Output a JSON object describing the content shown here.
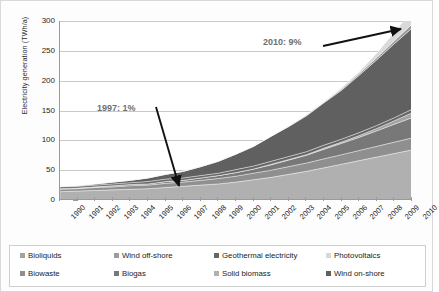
{
  "chart_data": {
    "type": "area",
    "stacked": true,
    "title": "",
    "xlabel": "",
    "ylabel": "Electricity generation (TWh/a)",
    "ylim": [
      0,
      300
    ],
    "yticks": [
      0,
      50,
      100,
      150,
      200,
      250,
      300
    ],
    "grid": true,
    "legend_position": "bottom",
    "x": [
      1990,
      1991,
      1992,
      1993,
      1994,
      1995,
      1996,
      1997,
      1998,
      1999,
      2000,
      2001,
      2002,
      2003,
      2004,
      2005,
      2006,
      2007,
      2008,
      2009,
      2010
    ],
    "categories": [
      "1990",
      "1991",
      "1992",
      "1993",
      "1994",
      "1995",
      "1996",
      "1997",
      "1998",
      "1999",
      "2000",
      "2001",
      "2002",
      "2003",
      "2004",
      "2005",
      "2006",
      "2007",
      "2008",
      "2009",
      "2010"
    ],
    "series": [
      {
        "name": "Solid biomass",
        "color": "#b0b0b0",
        "values": [
          14,
          15,
          16,
          17,
          18,
          19,
          21,
          23,
          25,
          27,
          30,
          34,
          38,
          43,
          48,
          54,
          60,
          66,
          72,
          78,
          84
        ]
      },
      {
        "name": "Biowaste",
        "color": "#8f8f8f",
        "values": [
          4,
          4,
          5,
          5,
          6,
          6,
          7,
          7,
          8,
          9,
          10,
          11,
          12,
          13,
          14,
          15,
          16,
          17,
          18,
          19,
          20
        ]
      },
      {
        "name": "Biogas",
        "color": "#787878",
        "values": [
          1,
          1,
          1,
          2,
          2,
          2,
          3,
          3,
          4,
          5,
          6,
          7,
          9,
          11,
          13,
          16,
          19,
          22,
          26,
          30,
          34
        ]
      },
      {
        "name": "Bioliquids",
        "color": "#a3a3a3",
        "values": [
          0,
          0,
          0,
          0,
          0,
          0,
          0,
          0,
          0,
          0,
          0,
          0,
          1,
          1,
          1,
          2,
          2,
          3,
          4,
          6,
          8
        ]
      },
      {
        "name": "Geothermal electricity",
        "color": "#666666",
        "values": [
          3,
          3,
          3,
          3,
          3,
          4,
          4,
          4,
          4,
          4,
          5,
          5,
          5,
          5,
          5,
          5,
          5,
          5,
          5,
          5,
          6
        ]
      },
      {
        "name": "Wind on-shore",
        "color": "#606060",
        "values": [
          1,
          1,
          2,
          3,
          4,
          6,
          8,
          11,
          15,
          20,
          26,
          33,
          42,
          50,
          60,
          71,
          82,
          96,
          110,
          124,
          136
        ]
      },
      {
        "name": "Wind off-shore",
        "color": "#9c9c9c",
        "values": [
          0,
          0,
          0,
          0,
          0,
          0,
          0,
          0,
          0,
          0,
          0,
          0,
          0,
          1,
          1,
          1,
          2,
          3,
          4,
          5,
          7
        ]
      },
      {
        "name": "Photovoltaics",
        "color": "#d9d9d9",
        "values": [
          0,
          0,
          0,
          0,
          0,
          0,
          0,
          0,
          0,
          0,
          0,
          0,
          0,
          0,
          1,
          1,
          2,
          3,
          7,
          14,
          22
        ]
      }
    ],
    "totals": [
      23,
      24,
      27,
      30,
      33,
      37,
      43,
      48,
      56,
      65,
      77,
      90,
      107,
      124,
      142,
      165,
      188,
      215,
      246,
      281,
      317
    ],
    "annotations": [
      {
        "text": "1997: 1%",
        "target_year": 1997
      },
      {
        "text": "2010: 9%",
        "target_year": 2010
      }
    ]
  },
  "axis": {
    "y_title": "Electricity generation (TWh/a)",
    "y_ticks": [
      "300",
      "250",
      "200",
      "150",
      "100",
      "50",
      "0"
    ],
    "x_ticks": [
      "1990",
      "1991",
      "1992",
      "1993",
      "1994",
      "1995",
      "1996",
      "1997",
      "1998",
      "1999",
      "2000",
      "2001",
      "2002",
      "2003",
      "2004",
      "2005",
      "2006",
      "2007",
      "2008",
      "2009",
      "2010"
    ]
  },
  "annotations": {
    "early": "1997: 1%",
    "late": "2010: 9%"
  },
  "legend": {
    "row1": [
      {
        "label": "Bioliquids",
        "color": "#a3a3a3"
      },
      {
        "label": "Wind off-shore",
        "color": "#9c9c9c"
      },
      {
        "label": "Geothermal electricity",
        "color": "#666666"
      },
      {
        "label": "Photovoltaics",
        "color": "#d9d9d9"
      }
    ],
    "row2": [
      {
        "label": "Biowaste",
        "color": "#8f8f8f"
      },
      {
        "label": "Biogas",
        "color": "#787878"
      },
      {
        "label": "Solid biomass",
        "color": "#b0b0b0"
      },
      {
        "label": "Wind on-shore",
        "color": "#606060"
      }
    ]
  }
}
